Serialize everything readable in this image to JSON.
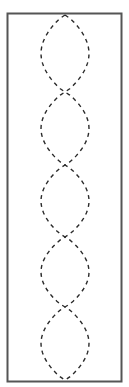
{
  "diagram": {
    "frame": {
      "x": 7.5,
      "y": 13.5,
      "width": 114,
      "height": 368,
      "stroke": "#555555",
      "stroke_width": 2
    },
    "strands": {
      "center_x": 65,
      "amplitude": 24,
      "crossings_y": [
        15,
        92,
        165,
        237,
        307,
        380
      ],
      "loop_count": 5,
      "stroke": "#2a2a2a",
      "stroke_width": 1.4,
      "dash": "4 4"
    },
    "background": "#ffffff"
  }
}
